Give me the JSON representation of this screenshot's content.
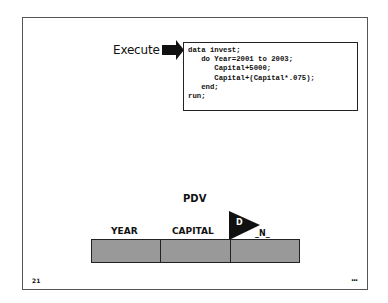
{
  "slide": {
    "execute_label": "Execute",
    "code_lines": [
      "data invest;",
      "   do Year=2001 to 2003;",
      "      Capital+5000;",
      "      Capital+(Capital*.075);",
      "   end;",
      "run;"
    ],
    "pdv": {
      "title": "PDV",
      "columns": [
        "YEAR",
        "CAPITAL",
        "_N_"
      ],
      "flag_letter": "D"
    },
    "page_number": "21",
    "more_indicator": "..."
  }
}
